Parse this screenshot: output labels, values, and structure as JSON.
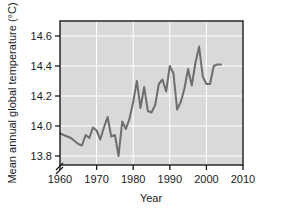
{
  "chart_data": {
    "type": "line",
    "title": "",
    "xlabel": "Year",
    "ylabel": "Mean annual global temperature (°C)",
    "xlim": [
      1960,
      2010
    ],
    "ylim": [
      13.74,
      14.7
    ],
    "xticks": [
      1960,
      1970,
      1980,
      1990,
      2000,
      2010
    ],
    "xticklabels": [
      "1960",
      "1970",
      "1980",
      "1990",
      "2000",
      "2010"
    ],
    "yticks": [
      13.8,
      14.0,
      14.2,
      14.4,
      14.6
    ],
    "yticklabels": [
      "13.8",
      "14.0",
      "14.2",
      "14.4",
      "14.6"
    ],
    "grid": true,
    "grid_color": "#ffffff",
    "plot_background": "#d9d9d9",
    "axis_break": true,
    "axis_break_symbol": "//",
    "legend": null,
    "series": [
      {
        "name": "Mean annual global temperature",
        "color": "#6e6e6e",
        "linewidth": 2.0,
        "x": [
          1960,
          1961,
          1962,
          1963,
          1964,
          1965,
          1966,
          1967,
          1968,
          1969,
          1970,
          1971,
          1972,
          1973,
          1974,
          1975,
          1976,
          1977,
          1978,
          1979,
          1980,
          1981,
          1982,
          1983,
          1984,
          1985,
          1986,
          1987,
          1988,
          1989,
          1990,
          1991,
          1992,
          1993,
          1994,
          1995,
          1996,
          1997,
          1998,
          1999,
          2000,
          2001,
          2002,
          2003,
          2004
        ],
        "values": [
          13.95,
          13.94,
          13.93,
          13.92,
          13.9,
          13.88,
          13.87,
          13.94,
          13.92,
          13.99,
          13.97,
          13.91,
          13.99,
          14.06,
          13.93,
          13.94,
          13.8,
          14.03,
          13.98,
          14.05,
          14.16,
          14.3,
          14.12,
          14.26,
          14.1,
          14.09,
          14.14,
          14.28,
          14.31,
          14.23,
          14.4,
          14.35,
          14.11,
          14.16,
          14.25,
          14.38,
          14.27,
          14.42,
          14.53,
          14.33,
          14.28,
          14.28,
          14.4,
          14.41,
          14.41
        ]
      }
    ]
  },
  "axes": {
    "y_axis_title": "Mean annual global temperature (°C)",
    "x_axis_title": "Year"
  }
}
